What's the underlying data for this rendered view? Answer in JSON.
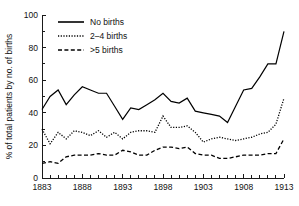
{
  "chart_data": {
    "type": "line",
    "title": "",
    "xlabel": "",
    "ylabel": "% of total patients by no. of births",
    "xlim": [
      1883,
      1913
    ],
    "ylim": [
      0,
      100
    ],
    "yticks": [
      0,
      20,
      40,
      60,
      80,
      100
    ],
    "xticks": [
      1883,
      1888,
      1893,
      1898,
      1903,
      1908,
      1913
    ],
    "xtick_labels": [
      "1883",
      "1888",
      "1893",
      "1898",
      "1903",
      "1908",
      "1913"
    ],
    "ytick_labels": [
      "0",
      "20",
      "40",
      "60",
      "80",
      "100"
    ],
    "minor_xticks_every": 1,
    "grid": false,
    "legend_position": "top-left-inside",
    "x": [
      1883,
      1884,
      1885,
      1886,
      1887,
      1888,
      1889,
      1890,
      1891,
      1892,
      1893,
      1894,
      1895,
      1896,
      1897,
      1898,
      1899,
      1900,
      1901,
      1902,
      1903,
      1904,
      1905,
      1906,
      1907,
      1908,
      1909,
      1910,
      1911,
      1912,
      1913
    ],
    "series": [
      {
        "name": "No births",
        "style": "solid",
        "color": "#000000",
        "values": [
          42,
          50,
          54,
          45,
          51,
          56,
          54,
          52,
          52,
          44,
          36,
          43,
          42,
          45,
          48,
          52,
          47,
          46,
          49,
          41,
          40,
          39,
          38,
          34,
          44,
          54,
          55,
          62,
          70,
          70,
          90
        ]
      },
      {
        "name": "2–4 births",
        "style": "dotted",
        "color": "#000000",
        "values": [
          30,
          21,
          28,
          24,
          29,
          28,
          26,
          29,
          25,
          28,
          24,
          28,
          29,
          29,
          28,
          38,
          31,
          31,
          32,
          28,
          22,
          24,
          25,
          24,
          23,
          24,
          25,
          27,
          28,
          33,
          49
        ]
      },
      {
        "name": ">5 births",
        "style": "dashed",
        "color": "#000000",
        "values": [
          9,
          10,
          9,
          13,
          14,
          14,
          14,
          15,
          14,
          14,
          17,
          16,
          14,
          14,
          17,
          19,
          19,
          18,
          19,
          15,
          14,
          14,
          12,
          12,
          13,
          14,
          14,
          14,
          15,
          15,
          24
        ]
      }
    ]
  },
  "legend": {
    "items": [
      {
        "label": "No births",
        "style": "solid"
      },
      {
        "label": "2–4 births",
        "style": "dotted"
      },
      {
        "label": ">5 births",
        "style": "dashed"
      }
    ]
  },
  "axes": {
    "y_axis_label": "% of total patients by no. of births"
  }
}
